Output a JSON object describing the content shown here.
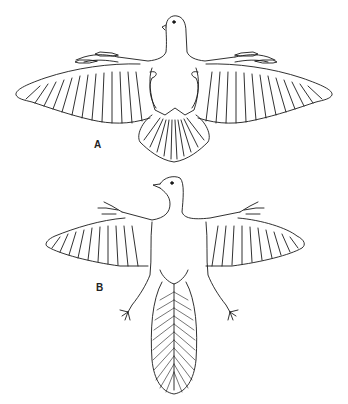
{
  "figure": {
    "panels": [
      {
        "label": "A",
        "subject": "modern-bird-ventral-view-wings-spread"
      },
      {
        "label": "B",
        "subject": "feathered-dinosaur-ventral-view-wings-spread-long-feathered-tail"
      }
    ],
    "colors": {
      "background": "#ffffff",
      "ink": "#1a1a1a"
    }
  }
}
